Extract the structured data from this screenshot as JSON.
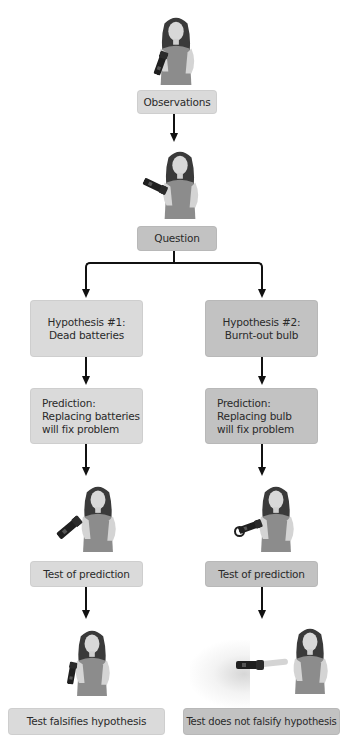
{
  "diagram": {
    "type": "flowchart",
    "topic": "Scientific method applied to a flashlight that does not work",
    "nodes": {
      "observations": {
        "label": "Observations"
      },
      "question": {
        "label": "Question"
      },
      "hypothesis1": {
        "label": "Hypothesis #1:\nDead batteries"
      },
      "hypothesis2": {
        "label": "Hypothesis #2:\nBurnt-out bulb"
      },
      "prediction1": {
        "label": "Prediction:\nReplacing batteries\nwill fix problem"
      },
      "prediction2": {
        "label": "Prediction:\nReplacing bulb\nwill fix problem"
      },
      "test1": {
        "label": "Test of prediction"
      },
      "test2": {
        "label": "Test of prediction"
      },
      "result1": {
        "label": "Test falsifies hypothesis"
      },
      "result2": {
        "label": "Test does not falsify hypothesis"
      }
    },
    "edges": [
      [
        "observations",
        "question"
      ],
      [
        "question",
        "hypothesis1"
      ],
      [
        "question",
        "hypothesis2"
      ],
      [
        "hypothesis1",
        "prediction1"
      ],
      [
        "hypothesis2",
        "prediction2"
      ],
      [
        "prediction1",
        "test1"
      ],
      [
        "prediction2",
        "test2"
      ],
      [
        "test1",
        "result1"
      ],
      [
        "test2",
        "result2"
      ]
    ],
    "illustrations": {
      "observe": "woman-holding-flashlight-icon",
      "question": "woman-thinking-with-flashlight-icon",
      "test1": "woman-replacing-batteries-icon",
      "test2": "woman-replacing-bulb-icon",
      "result1": "woman-with-dark-flashlight-icon",
      "result2": "woman-with-lit-flashlight-icon"
    },
    "colors": {
      "light_box": "#dadada",
      "dark_box": "#c2c2c2",
      "arrow": "#111111",
      "skin": "#d9d9d9",
      "hair": "#3a3a3a",
      "shirt": "#8a8a8a"
    }
  }
}
